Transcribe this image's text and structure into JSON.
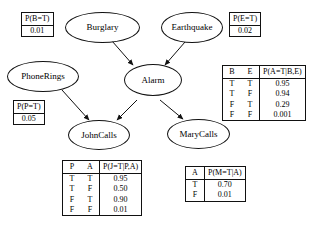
{
  "diagram": {
    "line_color": "#111111",
    "background": "#ffffff"
  },
  "nodes": {
    "burglary": {
      "label": "Burglary"
    },
    "earthquake": {
      "label": "Earthquake"
    },
    "phonerings": {
      "label": "PhoneRings"
    },
    "alarm": {
      "label": "Alarm"
    },
    "johncalls": {
      "label": "JohnCalls"
    },
    "marycalls": {
      "label": "MaryCalls"
    }
  },
  "tables": {
    "burglary_prior": {
      "header": "P(B=T)",
      "value": "0.01"
    },
    "earthquake_prior": {
      "header": "P(E=T)",
      "value": "0.02"
    },
    "phonerings_prior": {
      "header": "P(P=T)",
      "value": "0.05"
    },
    "alarm_cpt": {
      "cond_headers": [
        "B",
        "E"
      ],
      "prob_header": "P(A=T|B,E)",
      "rows": [
        {
          "cond": [
            "T",
            "T"
          ],
          "prob": "0.95"
        },
        {
          "cond": [
            "T",
            "F"
          ],
          "prob": "0.94"
        },
        {
          "cond": [
            "F",
            "T"
          ],
          "prob": "0.29"
        },
        {
          "cond": [
            "F",
            "F"
          ],
          "prob": "0.001"
        }
      ]
    },
    "johncalls_cpt": {
      "cond_headers": [
        "P",
        "A"
      ],
      "prob_header": "P(J=T|P,A)",
      "rows": [
        {
          "cond": [
            "T",
            "T"
          ],
          "prob": "0.95"
        },
        {
          "cond": [
            "T",
            "F"
          ],
          "prob": "0.50"
        },
        {
          "cond": [
            "F",
            "T"
          ],
          "prob": "0.90"
        },
        {
          "cond": [
            "F",
            "F"
          ],
          "prob": "0.01"
        }
      ]
    },
    "marycalls_cpt": {
      "cond_headers": [
        "A"
      ],
      "prob_header": "P(M=T|A)",
      "rows": [
        {
          "cond": [
            "T"
          ],
          "prob": "0.70"
        },
        {
          "cond": [
            "F"
          ],
          "prob": "0.01"
        }
      ]
    }
  },
  "edges": [
    {
      "from": "burglary",
      "to": "alarm"
    },
    {
      "from": "earthquake",
      "to": "alarm"
    },
    {
      "from": "phonerings",
      "to": "johncalls"
    },
    {
      "from": "alarm",
      "to": "johncalls"
    },
    {
      "from": "alarm",
      "to": "marycalls"
    }
  ]
}
